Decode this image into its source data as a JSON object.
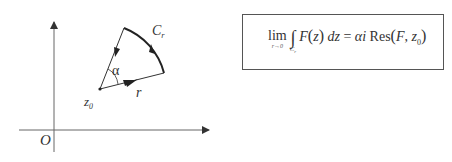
{
  "diagram": {
    "axes": {
      "origin_label": "O",
      "x_axis": {
        "from": [
          19,
          130
        ],
        "to": [
          210,
          130
        ]
      },
      "y_axis": {
        "from": [
          54,
          152
        ],
        "to": [
          54,
          21
        ]
      }
    },
    "sector": {
      "center_label": "z",
      "center_subscript": "0",
      "center": [
        100,
        89
      ],
      "radius_label": "r",
      "angle_label": "α",
      "arc_label": "C",
      "arc_subscript": "r",
      "arc_start": [
        164,
        73
      ],
      "arc_end": [
        124,
        28
      ]
    }
  },
  "formula": {
    "lim": "lim",
    "lim_sub": "r→0",
    "integral": "∫",
    "integral_sub": "C",
    "integral_sub_index": "r",
    "integrand_F": "F",
    "integrand_var": "z",
    "differential": "dz",
    "equals": "=",
    "alpha": "α",
    "imag": "i",
    "res": "Res",
    "res_arg_F": "F",
    "res_arg_z": "z",
    "res_arg_z_sub": "0",
    "full_text": "lim_{r→0} ∫_{C_r} F(z) dz = αi Res(F, z_0)"
  },
  "colors": {
    "stroke": "#333333",
    "box_border": "#555555",
    "background": "#ffffff"
  }
}
